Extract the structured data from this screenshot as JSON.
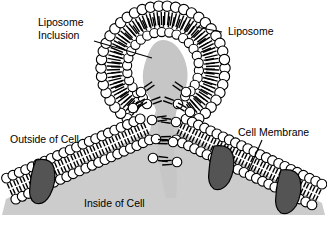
{
  "figure": {
    "type": "biological-diagram",
    "width": 327,
    "height": 227,
    "background": "#ffffff"
  },
  "labels": {
    "liposome_inclusion_line1": "Liposome",
    "liposome_inclusion_line2": "Inclusion",
    "liposome": "Liposome",
    "outside_of_cell": "Outside of Cell",
    "cell_membrane": "Cell Membrane",
    "inside_of_cell": "Inside of Cell"
  },
  "colors": {
    "outline": "#000000",
    "lipid_head_fill": "#ffffff",
    "cytoplasm_gray": "#cccccc",
    "inclusion_gray": "#c6c6c6",
    "protein_gray": "#545454",
    "text": "#000000"
  },
  "structures": {
    "liposome": {
      "name": "liposome",
      "center_x": 163,
      "center_y": 68,
      "outer_radius": 62,
      "inner_radius": 36,
      "outer_head_count": 46,
      "inner_head_count": 30,
      "head_radius_outer": 5.2,
      "head_radius_inner": 4.6,
      "description": "phospholipid bilayer vesicle, heads outward and inward, tails meeting in the middle"
    },
    "inclusion": {
      "name": "liposome-inclusion",
      "description": "gray cargo material inside liposome lumen, continuous with fusion neck"
    },
    "fusion_neck": {
      "name": "fusion-neck",
      "description": "gray channel connecting liposome lumen to cell interior through the membrane pore",
      "top_y": 95,
      "bottom_y": 185
    },
    "cell_membrane": {
      "name": "cell-membrane-bilayer",
      "shape": "V-shaped / tented bilayer descending from the fusion pore to both sides",
      "left_arm": {
        "x1": 8,
        "y1": 190,
        "x2": 148,
        "y2": 128
      },
      "right_arm": {
        "x1": 178,
        "y1": 128,
        "x2": 320,
        "y2": 196
      }
    },
    "membrane_proteins": [
      {
        "name": "membrane-protein-1",
        "side": "left",
        "x": 44,
        "y": 180
      },
      {
        "name": "membrane-protein-2",
        "side": "right",
        "x": 222,
        "y": 166
      },
      {
        "name": "membrane-protein-3",
        "side": "right",
        "x": 289,
        "y": 190
      }
    ],
    "cytoplasm": {
      "name": "inside-of-cell-region",
      "description": "light gray filled triangular region beneath the membrane"
    }
  },
  "leader_lines": [
    {
      "name": "leader-liposome-inclusion",
      "from_label": "Liposome Inclusion",
      "x1": 94,
      "y1": 41,
      "x2": 152,
      "y2": 58
    },
    {
      "name": "leader-liposome",
      "from_label": "Liposome",
      "x1": 222,
      "y1": 32,
      "x2": 196,
      "y2": 27
    },
    {
      "name": "leader-cell-membrane",
      "from_label": "Cell Membrane",
      "x1": 262,
      "y1": 140,
      "x2": 248,
      "y2": 172
    }
  ]
}
